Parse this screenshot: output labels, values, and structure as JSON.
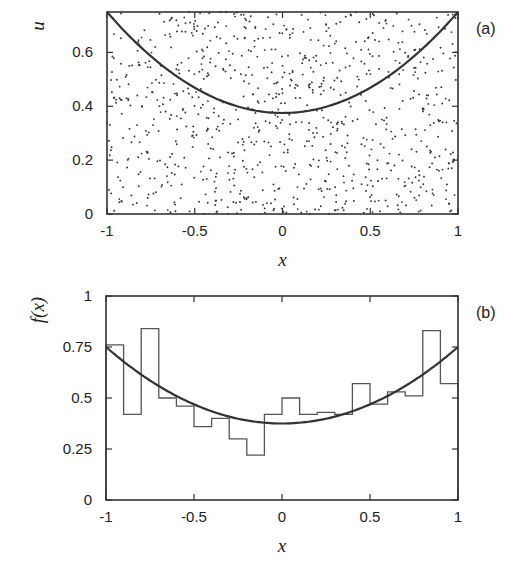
{
  "figure": {
    "panels": [
      "(a)",
      "(b)"
    ]
  },
  "chart_data": [
    {
      "type": "scatter",
      "panel_label": "(a)",
      "title": "",
      "xlabel": "x",
      "ylabel": "u",
      "xlim": [
        -1,
        1
      ],
      "ylim": [
        0,
        0.75
      ],
      "xticks": [
        "-1",
        "-0.5",
        "0",
        "0.5",
        "1"
      ],
      "yticks": [
        "0",
        "0.2",
        "0.4",
        "0.6"
      ],
      "xtick_values": [
        -1,
        -0.5,
        0,
        0.5,
        1
      ],
      "ytick_values": [
        0,
        0.2,
        0.4,
        0.6
      ],
      "grid": false,
      "legend": null,
      "points": {
        "description": "uniform random points filling rectangle [-1,1]x[0,0.75] (approx. 900 points)",
        "count": 900,
        "seed": 12345
      },
      "curve": {
        "name": "f(x)",
        "expression": "0.375*(1+x^2)",
        "x": [
          -1,
          -0.75,
          -0.5,
          -0.25,
          0,
          0.25,
          0.5,
          0.75,
          1
        ],
        "y": [
          0.75,
          0.586,
          0.469,
          0.398,
          0.375,
          0.398,
          0.469,
          0.586,
          0.75
        ]
      }
    },
    {
      "type": "bar",
      "subtype": "histogram-step",
      "panel_label": "(b)",
      "title": "",
      "xlabel": "x",
      "ylabel": "f(x)",
      "xlim": [
        -1,
        1
      ],
      "ylim": [
        0,
        1
      ],
      "xticks": [
        "-1",
        "-0.5",
        "0",
        "0.5",
        "1"
      ],
      "yticks": [
        "0",
        "0.25",
        "0.5",
        "0.75",
        "1"
      ],
      "xtick_values": [
        -1,
        -0.5,
        0,
        0.5,
        1
      ],
      "ytick_values": [
        0,
        0.25,
        0.5,
        0.75,
        1
      ],
      "grid": false,
      "legend": null,
      "bin_edges": [
        -1,
        -0.9,
        -0.8,
        -0.7,
        -0.6,
        -0.5,
        -0.4,
        -0.3,
        -0.2,
        -0.1,
        0,
        0.1,
        0.2,
        0.3,
        0.4,
        0.5,
        0.6,
        0.7,
        0.8,
        0.9,
        1
      ],
      "values": [
        0.76,
        0.42,
        0.84,
        0.5,
        0.46,
        0.36,
        0.4,
        0.3,
        0.22,
        0.42,
        0.5,
        0.42,
        0.43,
        0.42,
        0.57,
        0.47,
        0.53,
        0.51,
        0.83,
        0.57
      ],
      "curve": {
        "name": "f(x)",
        "expression": "0.375*(1+x^2)",
        "x": [
          -1,
          -0.75,
          -0.5,
          -0.25,
          0,
          0.25,
          0.5,
          0.75,
          1
        ],
        "y": [
          0.75,
          0.586,
          0.469,
          0.398,
          0.375,
          0.398,
          0.469,
          0.586,
          0.75
        ]
      }
    }
  ],
  "style": {
    "ink": "#222222",
    "dot": "#333333",
    "background": "#ffffff"
  }
}
